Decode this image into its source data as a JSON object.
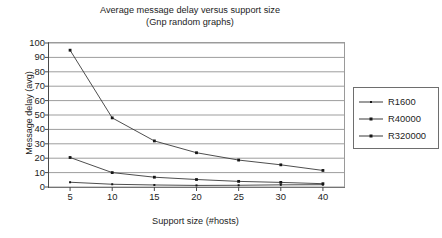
{
  "chart_data": {
    "type": "line",
    "title": "Average message delay versus support size",
    "subtitle": "(Gnp random graphs)",
    "xlabel": "Support size (#hosts)",
    "ylabel": "Message delay (avg)",
    "categories": [
      "5",
      "10",
      "15",
      "20",
      "25",
      "30",
      "40"
    ],
    "xticks": [
      "5",
      "10",
      "15",
      "20",
      "25",
      "30",
      "40"
    ],
    "yticks": [
      "0",
      "10",
      "20",
      "30",
      "40",
      "50",
      "60",
      "70",
      "80",
      "90",
      "100"
    ],
    "ylim": [
      0,
      100
    ],
    "grid": "horizontal",
    "legend_position": "right",
    "series": [
      {
        "name": "R1600",
        "values": [
          3.3,
          1.9,
          1.4,
          1.1,
          1.2,
          1.5,
          1.6
        ],
        "marker": "small-square",
        "color": "#3a3a3a"
      },
      {
        "name": "R40000",
        "values": [
          20.5,
          10.0,
          6.8,
          5.2,
          3.9,
          3.2,
          2.3
        ],
        "marker": "square",
        "color": "#3a3a3a"
      },
      {
        "name": "R320000",
        "values": [
          95.0,
          48.0,
          32.0,
          23.8,
          18.7,
          15.4,
          11.5
        ],
        "marker": "square",
        "color": "#3a3a3a"
      }
    ]
  },
  "legend": {
    "items": [
      {
        "label": "R1600"
      },
      {
        "label": "R40000"
      },
      {
        "label": "R320000"
      }
    ]
  }
}
